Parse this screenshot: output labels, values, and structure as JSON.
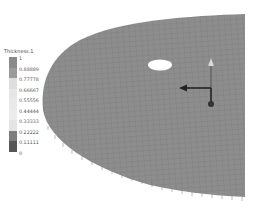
{
  "legend": {
    "title": "Thickness.1",
    "labels": [
      "1",
      "0.88889",
      "0.77778",
      "0.66667",
      "0.55556",
      "0.44444",
      "0.33333",
      "0.22222",
      "0.11111",
      "0"
    ],
    "colors": [
      "#8a8a8a",
      "#9b9b9b",
      "#dedede",
      "#e6e6e6",
      "#e9e9e9",
      "#ececec",
      "#e4e4e4",
      "#7d7d7d",
      "#565656"
    ]
  },
  "surface": {
    "fill": "#8d8d8d",
    "mesh_color": "#6f6f6f",
    "hole_color": "#ffffff"
  },
  "axes": {
    "color": "#333333",
    "z_arrow_color": "#d9d9d9"
  }
}
